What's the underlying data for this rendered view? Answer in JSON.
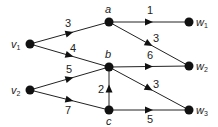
{
  "diagram": {
    "type": "directed weighted graph",
    "nodes": [
      {
        "id": "v1",
        "label": "v",
        "sub": "1",
        "x": 30,
        "y": 44,
        "lx": 11,
        "ly": 48
      },
      {
        "id": "v2",
        "label": "v",
        "sub": "2",
        "x": 30,
        "y": 90,
        "lx": 11,
        "ly": 94
      },
      {
        "id": "a",
        "label": "a",
        "sub": "",
        "x": 109,
        "y": 22,
        "lx": 105,
        "ly": 13
      },
      {
        "id": "b",
        "label": "b",
        "sub": "",
        "x": 109,
        "y": 67,
        "lx": 105,
        "ly": 58
      },
      {
        "id": "c",
        "label": "c",
        "sub": "",
        "x": 109,
        "y": 110,
        "lx": 106,
        "ly": 125
      },
      {
        "id": "w1",
        "label": "w",
        "sub": "1",
        "x": 189,
        "y": 22,
        "lx": 196,
        "ly": 26
      },
      {
        "id": "w2",
        "label": "w",
        "sub": "2",
        "x": 189,
        "y": 66,
        "lx": 196,
        "ly": 70
      },
      {
        "id": "w3",
        "label": "w",
        "sub": "3",
        "x": 189,
        "y": 110,
        "lx": 196,
        "ly": 114
      }
    ],
    "edges": [
      {
        "from": "v1",
        "to": "a",
        "weight": "3",
        "wx": 65,
        "wy": 27
      },
      {
        "from": "v1",
        "to": "b",
        "weight": "4",
        "wx": 70,
        "wy": 52
      },
      {
        "from": "v2",
        "to": "b",
        "weight": "5",
        "wx": 66,
        "wy": 73
      },
      {
        "from": "v2",
        "to": "c",
        "weight": "7",
        "wx": 65,
        "wy": 114
      },
      {
        "from": "a",
        "to": "w1",
        "weight": "1",
        "wx": 147,
        "wy": 14
      },
      {
        "from": "a",
        "to": "w2",
        "weight": "3",
        "wx": 153,
        "wy": 42
      },
      {
        "from": "b",
        "to": "w2",
        "weight": "6",
        "wx": 147,
        "wy": 59
      },
      {
        "from": "b",
        "to": "w3",
        "weight": "3",
        "wx": 153,
        "wy": 88
      },
      {
        "from": "c",
        "to": "b",
        "weight": "2",
        "wx": 98,
        "wy": 93
      },
      {
        "from": "c",
        "to": "w3",
        "weight": "5",
        "wx": 147,
        "wy": 123
      }
    ]
  }
}
